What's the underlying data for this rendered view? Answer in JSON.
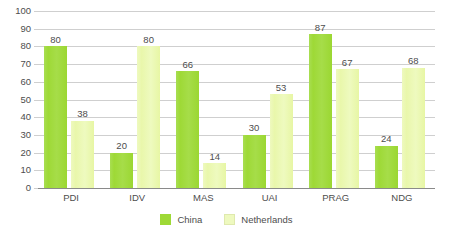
{
  "chart_data": {
    "type": "bar",
    "title": "",
    "subtitle": "",
    "xlabel": "",
    "ylabel": "",
    "ylim": [
      0,
      100
    ],
    "yticks": [
      0,
      10,
      20,
      30,
      40,
      50,
      60,
      70,
      80,
      90,
      100
    ],
    "ytick_labels": [
      "0",
      "10",
      "20",
      "30",
      "40",
      "50",
      "60",
      "70",
      "80",
      "90",
      "100"
    ],
    "grid": true,
    "legend_position": "bottom-center",
    "categories": [
      "PDI",
      "IDV",
      "MAS",
      "UAI",
      "PRAG",
      "NDG"
    ],
    "series": [
      {
        "name": "China",
        "color": "#9ed936",
        "values": [
          80,
          20,
          66,
          30,
          87,
          24
        ],
        "value_labels": [
          "80",
          "20",
          "66",
          "30",
          "87",
          "24"
        ]
      },
      {
        "name": "Netherlands",
        "color": "#eef9bf",
        "values": [
          38,
          80,
          14,
          53,
          67,
          68
        ],
        "value_labels": [
          "38",
          "80",
          "14",
          "53",
          "67",
          "68"
        ]
      }
    ]
  },
  "legend": {
    "items": [
      {
        "label": "China",
        "swatch": "legend-swatch-china"
      },
      {
        "label": "Netherlands",
        "swatch": "legend-swatch-netherlands"
      }
    ]
  },
  "axis": {
    "y_tick_labels": [
      "100",
      "90",
      "80",
      "70",
      "60",
      "50",
      "40",
      "30",
      "20",
      "10",
      "0"
    ],
    "x_tick_labels": [
      "PDI",
      "IDV",
      "MAS",
      "UAI",
      "PRAG",
      "NDG"
    ]
  },
  "colors": {
    "china": "#9ed936",
    "netherlands": "#eef9bf",
    "gridline": "#cfcfcf",
    "baseline": "#8a8a8a",
    "text": "#4d4d4d",
    "background": "#ffffff"
  }
}
